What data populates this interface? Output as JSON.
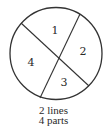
{
  "diagram": {
    "colors": {
      "stroke": "#333333",
      "text": "#2a2a2a",
      "background": "#ffffff"
    },
    "circle": {
      "cx": 56,
      "cy": 53.5,
      "r": 46
    },
    "lines": [
      {
        "x1": 21,
        "y1": 23,
        "x2": 89,
        "y2": 86
      },
      {
        "x1": 80,
        "y1": 14,
        "x2": 40,
        "y2": 98
      }
    ],
    "regions": [
      {
        "label": "1",
        "x": 55,
        "y": 34
      },
      {
        "label": "2",
        "x": 83,
        "y": 55
      },
      {
        "label": "4",
        "x": 31,
        "y": 66
      },
      {
        "label": "3",
        "x": 64,
        "y": 86
      }
    ],
    "caption": {
      "line1": "2 lines",
      "line2": "4 parts"
    }
  }
}
